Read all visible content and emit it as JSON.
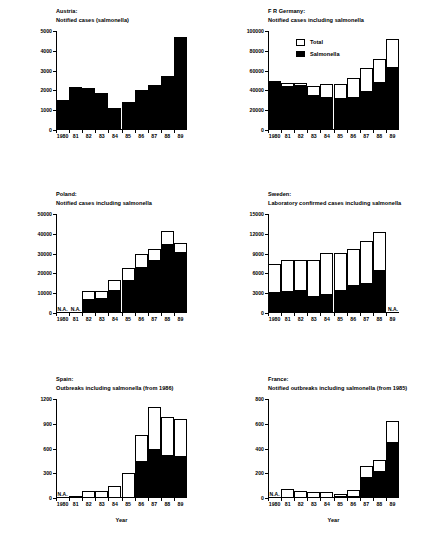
{
  "figure": {
    "xlabel": "Year",
    "na_text": "N.A.",
    "years": [
      "1980",
      "81",
      "82",
      "83",
      "84",
      "85",
      "86",
      "87",
      "88",
      "89"
    ]
  },
  "legend": {
    "total_label": "Total",
    "salmonella_label": "Salmonella"
  },
  "chart_data": [
    {
      "id": "austria",
      "type": "bar",
      "title_line1": "Austria:",
      "title_line2": "Notified cases (salmonella)",
      "xlabel": "",
      "ylabel": "",
      "categories": [
        "1980",
        "81",
        "82",
        "83",
        "84",
        "85",
        "86",
        "87",
        "88",
        "89"
      ],
      "yticks": [
        0,
        1000,
        2000,
        3000,
        4000,
        5000
      ],
      "ytick_labels": [
        "0",
        "1000",
        "2000",
        "3000",
        "4000",
        "5000"
      ],
      "ylim": [
        0,
        5000
      ],
      "series": [
        {
          "name": "Salmonella",
          "values": [
            1520,
            2180,
            2130,
            1880,
            1130,
            1400,
            2000,
            2250,
            2720,
            4680
          ]
        }
      ],
      "na_years": [],
      "grid": false,
      "legend": false
    },
    {
      "id": "fr-germany",
      "type": "bar",
      "title_line1": "F R Germany:",
      "title_line2": "Notified cases including salmonella",
      "xlabel": "",
      "ylabel": "",
      "categories": [
        "1980",
        "81",
        "82",
        "83",
        "84",
        "85",
        "86",
        "87",
        "88",
        "89"
      ],
      "yticks": [
        0,
        20000,
        40000,
        60000,
        80000,
        100000
      ],
      "ytick_labels": [
        "0",
        "20000",
        "40000",
        "60000",
        "80000",
        "100000"
      ],
      "ylim": [
        0,
        100000
      ],
      "series": [
        {
          "name": "Total",
          "values": [
            50000,
            47000,
            47500,
            44000,
            46500,
            46000,
            52500,
            62500,
            72000,
            91500
          ]
        },
        {
          "name": "Salmonella",
          "values": [
            50000,
            44500,
            45500,
            35500,
            33000,
            32500,
            33000,
            39000,
            48000,
            63500
          ]
        }
      ],
      "na_years": [],
      "grid": false,
      "legend": true
    },
    {
      "id": "poland",
      "type": "bar",
      "title_line1": "Poland:",
      "title_line2": "Notified cases including salmonella",
      "xlabel": "",
      "ylabel": "",
      "categories": [
        "1980",
        "81",
        "82",
        "83",
        "84",
        "85",
        "86",
        "87",
        "88",
        "89"
      ],
      "yticks": [
        0,
        10000,
        20000,
        30000,
        40000,
        50000
      ],
      "ytick_labels": [
        "0",
        "10000",
        "20000",
        "30000",
        "40000",
        "50000"
      ],
      "ylim": [
        0,
        50000
      ],
      "series": [
        {
          "name": "Total",
          "values": [
            null,
            null,
            11000,
            11000,
            16500,
            22500,
            30000,
            32500,
            41500,
            35500
          ]
        },
        {
          "name": "Salmonella",
          "values": [
            null,
            null,
            7000,
            7500,
            11500,
            16500,
            23000,
            27000,
            35000,
            31000
          ]
        }
      ],
      "na_years": [
        "1980",
        "81"
      ],
      "grid": false,
      "legend": false
    },
    {
      "id": "sweden",
      "type": "bar",
      "title_line1": "Sweden:",
      "title_line2": "Laboratory confirmed cases including salmonella",
      "xlabel": "",
      "ylabel": "",
      "categories": [
        "1980",
        "81",
        "82",
        "83",
        "84",
        "85",
        "86",
        "87",
        "88",
        "89"
      ],
      "yticks": [
        0,
        3000,
        6000,
        9000,
        12000,
        15000
      ],
      "ytick_labels": [
        "0",
        "3000",
        "6000",
        "9000",
        "12000",
        "15000"
      ],
      "ylim": [
        0,
        15000
      ],
      "series": [
        {
          "name": "Total",
          "values": [
            7500,
            8100,
            8100,
            8050,
            9050,
            9150,
            9750,
            10900,
            12250,
            null
          ]
        },
        {
          "name": "Salmonella",
          "values": [
            3200,
            3300,
            3450,
            2650,
            2900,
            3500,
            4300,
            4600,
            6500,
            null
          ]
        }
      ],
      "na_years": [
        "89"
      ],
      "grid": false,
      "legend": false
    },
    {
      "id": "spain",
      "type": "bar",
      "title_line1": "Spain:",
      "title_line2": "Outbreaks including salmonella (from 1986)",
      "xlabel": "Year",
      "ylabel": "",
      "categories": [
        "1980",
        "81",
        "82",
        "83",
        "84",
        "85",
        "86",
        "87",
        "88",
        "89"
      ],
      "yticks": [
        0,
        300,
        600,
        900,
        1200
      ],
      "ytick_labels": [
        "0",
        "300",
        "600",
        "900",
        "1200"
      ],
      "ylim": [
        0,
        1200
      ],
      "series": [
        {
          "name": "Total",
          "values": [
            null,
            30,
            80,
            90,
            145,
            300,
            760,
            1100,
            980,
            960
          ]
        },
        {
          "name": "Salmonella",
          "values": [
            null,
            null,
            null,
            null,
            null,
            null,
            450,
            590,
            520,
            510
          ]
        }
      ],
      "na_years": [
        "1980"
      ],
      "grid": false,
      "legend": false
    },
    {
      "id": "france",
      "type": "bar",
      "title_line1": "France:",
      "title_line2": "Notified outbreaks including salmonella (from 1985)",
      "xlabel": "Year",
      "ylabel": "",
      "categories": [
        "1980",
        "81",
        "82",
        "83",
        "84",
        "85",
        "86",
        "87",
        "88",
        "89"
      ],
      "yticks": [
        0,
        200,
        400,
        600,
        800
      ],
      "ytick_labels": [
        "0",
        "200",
        "400",
        "600",
        "800"
      ],
      "ylim": [
        0,
        800
      ],
      "series": [
        {
          "name": "Total",
          "values": [
            null,
            70,
            55,
            52,
            50,
            35,
            62,
            260,
            310,
            620
          ]
        },
        {
          "name": "Salmonella",
          "values": [
            null,
            null,
            null,
            null,
            null,
            18,
            15,
            170,
            215,
            455
          ]
        }
      ],
      "na_years": [
        "1980"
      ],
      "grid": false,
      "legend": false
    }
  ]
}
